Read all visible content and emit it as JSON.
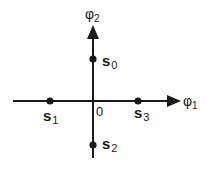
{
  "diagram": {
    "type": "signal-constellation",
    "axes": {
      "horizontal": {
        "symbol": "φ",
        "subscript": "1"
      },
      "vertical": {
        "symbol": "φ",
        "subscript": "2"
      },
      "origin_label": "0"
    },
    "points": [
      {
        "id": "s0",
        "base": "s",
        "subscript": "0",
        "position": "positive vertical axis"
      },
      {
        "id": "s1",
        "base": "s",
        "subscript": "1",
        "position": "negative horizontal axis"
      },
      {
        "id": "s2",
        "base": "s",
        "subscript": "2",
        "position": "negative vertical axis"
      },
      {
        "id": "s3",
        "base": "s",
        "subscript": "3",
        "position": "positive horizontal axis"
      }
    ],
    "colors": {
      "ink": "#1a1a1a",
      "background": "#ffffff"
    }
  }
}
